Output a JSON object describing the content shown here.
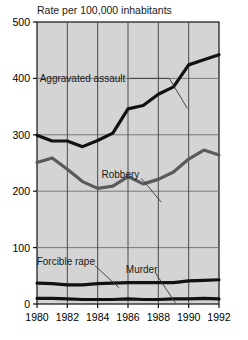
{
  "header": {
    "cut_title": "Violent Crime",
    "subtitle": "Rate per 100,000 inhabitants"
  },
  "chart_data": {
    "type": "line",
    "title": "Rate per 100,000 inhabitants",
    "xlabel": "",
    "ylabel": "Rate per 100,000 inhabitants",
    "xlim": [
      1980,
      1992
    ],
    "ylim": [
      0,
      500
    ],
    "grid": true,
    "legend_position": "inline-annotations",
    "x": [
      1980,
      1981,
      1982,
      1983,
      1984,
      1985,
      1986,
      1987,
      1988,
      1989,
      1990,
      1991,
      1992
    ],
    "xticks": [
      "1980",
      "1982",
      "1984",
      "1986",
      "1988",
      "1990",
      "1992"
    ],
    "yticks": [
      "0",
      "100",
      "200",
      "300",
      "400",
      "500"
    ],
    "series": [
      {
        "name": "Aggravated assault",
        "color": "#111111",
        "values": [
          299,
          289,
          289,
          279,
          290,
          303,
          346,
          352,
          372,
          385,
          424,
          433,
          442
        ]
      },
      {
        "name": "Robbery",
        "color": "#5a5a5a",
        "values": [
          251,
          259,
          239,
          217,
          205,
          209,
          226,
          213,
          221,
          234,
          257,
          273,
          264
        ]
      },
      {
        "name": "Forcible rape",
        "color": "#111111",
        "values": [
          37,
          36,
          34,
          34,
          36,
          37,
          38,
          38,
          38,
          38,
          41,
          42,
          43
        ]
      },
      {
        "name": "Murder",
        "color": "#111111",
        "values": [
          10,
          10,
          9,
          8,
          8,
          8,
          9,
          8,
          8,
          9,
          9,
          10,
          9
        ]
      }
    ],
    "annotations": [
      {
        "text": "Aggravated assault",
        "x": 1983.0,
        "y": 400
      },
      {
        "text": "Robbery",
        "x": 1985.5,
        "y": 230
      },
      {
        "text": "Forcible rape",
        "x": 1981.9,
        "y": 75
      },
      {
        "text": "Murder",
        "x": 1986.9,
        "y": 62
      }
    ]
  }
}
